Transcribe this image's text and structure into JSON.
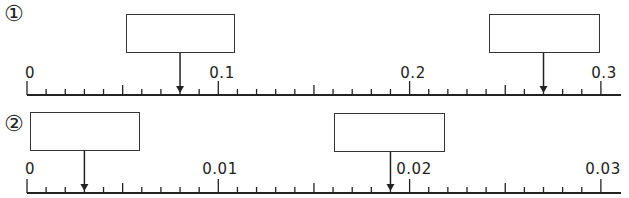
{
  "problems": [
    {
      "label": "①",
      "axis": {
        "min": 0,
        "max": 0.3,
        "major_step": 0.1,
        "minor_step": 0.01,
        "mid_step": 0.05,
        "tick_labels": [
          "0",
          "0.1",
          "0.2",
          "0.3"
        ]
      },
      "blanks": [
        {
          "value_pointed": 0.08,
          "answer": ""
        },
        {
          "value_pointed": 0.27,
          "answer": ""
        }
      ]
    },
    {
      "label": "②",
      "axis": {
        "min": 0,
        "max": 0.03,
        "major_step": 0.01,
        "minor_step": 0.001,
        "mid_step": 0.005,
        "tick_labels": [
          "0",
          "0.01",
          "0.02",
          "0.03"
        ]
      },
      "blanks": [
        {
          "value_pointed": 0.003,
          "answer": ""
        },
        {
          "value_pointed": 0.019,
          "answer": ""
        }
      ]
    }
  ],
  "colors": {
    "line": "#222222",
    "box_border": "#333333",
    "background": "#ffffff"
  }
}
